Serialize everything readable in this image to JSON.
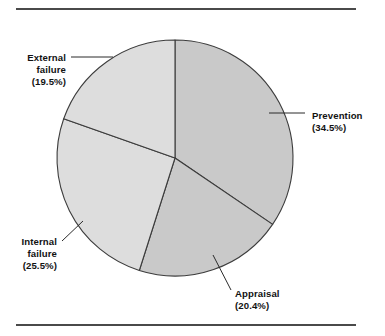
{
  "figure": {
    "background_color": "#ffffff",
    "rule_color": "#4a4a4a",
    "top_rule": {
      "x1": 16,
      "y1": 9,
      "x2": 356,
      "y2": 9
    },
    "bottom_rule": {
      "x1": 16,
      "y1": 325,
      "x2": 356,
      "y2": 325
    }
  },
  "chart_data": {
    "type": "pie",
    "title": "",
    "subtitle": "",
    "xlabel": "",
    "ylabel": "",
    "legend_position": "none",
    "grid": false,
    "start_angle_deg": 90,
    "direction": "clockwise",
    "center": {
      "x": 175,
      "y": 158
    },
    "radius": 118,
    "categories": [
      "Prevention",
      "Appraisal",
      "Internal failure",
      "External failure"
    ],
    "values": [
      34.5,
      20.4,
      25.5,
      19.5
    ],
    "value_unit": "%",
    "slices": [
      {
        "name": "Prevention",
        "label_line1": "Prevention",
        "label_line2": "(34.5%)",
        "value": 34.5,
        "color": "#c9c9c9",
        "start_deg": 0.0,
        "end_deg": 124.2,
        "label_x": 312,
        "label_y": 119,
        "label_x2": 312,
        "label_y2": 131,
        "leader": {
          "x1": 269,
          "y1": 113,
          "x2": 305,
          "y2": 113
        }
      },
      {
        "name": "Appraisal",
        "label_line1": "Appraisal",
        "label_line2": "(20.4%)",
        "value": 20.4,
        "color": "#c9c9c9",
        "start_deg": 124.2,
        "end_deg": 197.6,
        "label_x": 235,
        "label_y": 297,
        "label_x2": 235,
        "label_y2": 309,
        "leader": {
          "x1": 213,
          "y1": 255,
          "x2": 231,
          "y2": 290
        }
      },
      {
        "name": "Internal failure",
        "label_line1": "Internal",
        "label_line2": "failure",
        "label_line3": "(25.5%)",
        "value": 25.5,
        "color": "#dddddd",
        "start_deg": 197.6,
        "end_deg": 289.4,
        "label_x": 57,
        "label_y": 245,
        "label_x2": 57,
        "label_y2": 257,
        "label_x3": 57,
        "label_y3": 269,
        "leader": {
          "x1": 62,
          "y1": 241,
          "x2": 83,
          "y2": 221
        }
      },
      {
        "name": "External failure",
        "label_line1": "External",
        "label_line2": "failure",
        "label_line3": "(19.5%)",
        "value": 19.5,
        "color": "#dddddd",
        "start_deg": 289.4,
        "end_deg": 360.0,
        "label_x": 66,
        "label_y": 61,
        "label_x2": 66,
        "label_y2": 73,
        "label_x3": 66,
        "label_y3": 85,
        "leader": {
          "x1": 71,
          "y1": 57,
          "x2": 113,
          "y2": 57
        }
      }
    ]
  }
}
